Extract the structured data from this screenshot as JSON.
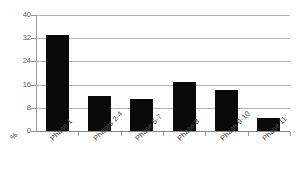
{
  "chart_data": {
    "type": "bar",
    "title": "",
    "subtitle": "",
    "xlabel": "",
    "ylabel": "%",
    "unit_label": "%",
    "categories": [
      "Phase 1",
      "Phases 2-4",
      "Phase 5-7",
      "Phase 8",
      "Phase 9-10",
      "Phase 11"
    ],
    "values": [
      33,
      12,
      11,
      17,
      14,
      4.5
    ],
    "ylim": [
      0,
      40
    ],
    "yticks": [
      0,
      8,
      16,
      24,
      32,
      40
    ],
    "ytick_labels": [
      "0",
      "8",
      "16",
      "24",
      "32",
      "40"
    ],
    "grid": true,
    "grid_axis": "y",
    "legend": false,
    "legend_position": "none",
    "bar_color": "#0a0a0a",
    "grid_color": "#b4b4b4",
    "axis_color": "#8a8a8a",
    "background_color": "#ffffff",
    "label_rotation": -45
  }
}
